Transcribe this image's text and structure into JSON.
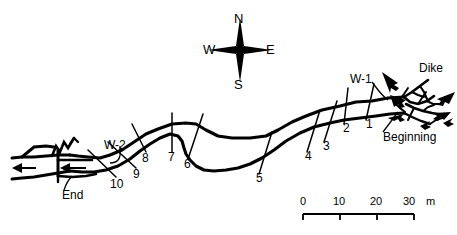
{
  "figure": {
    "type": "geologic-plan-map",
    "width": 457,
    "height": 235,
    "background_color": "#ffffff",
    "line_color": "#000000"
  },
  "compass": {
    "name": "compass-rose",
    "north": "N",
    "east": "E",
    "south": "S",
    "west": "W",
    "center_x": 240,
    "center_y": 50
  },
  "annotations": {
    "dike": "Dike",
    "beginning": "Beginning",
    "end": "End",
    "well_1": "W-1",
    "well_2": "W-2"
  },
  "stations": [
    {
      "label": "1",
      "x": 370,
      "y": 122
    },
    {
      "label": "2",
      "x": 347,
      "y": 127
    },
    {
      "label": "3",
      "x": 327,
      "y": 145
    },
    {
      "label": "4",
      "x": 310,
      "y": 155
    },
    {
      "label": "5",
      "x": 260,
      "y": 178
    },
    {
      "label": "6",
      "x": 187,
      "y": 163
    },
    {
      "label": "7",
      "x": 171,
      "y": 156
    },
    {
      "label": "8",
      "x": 145,
      "y": 157
    },
    {
      "label": "9",
      "x": 135,
      "y": 172
    },
    {
      "label": "10",
      "x": 115,
      "y": 182
    }
  ],
  "scalebar": {
    "name": "scale-bar",
    "unit": "m",
    "ticks": [
      {
        "label": "0",
        "x": 303
      },
      {
        "label": "10",
        "x": 340
      },
      {
        "label": "20",
        "x": 374
      },
      {
        "label": "30",
        "x": 406
      }
    ],
    "unit_label_x": 424,
    "label_y": 200,
    "bar_y": 214,
    "bar_left": 303,
    "bar_right": 414,
    "max_value": 30,
    "interval": 10
  }
}
